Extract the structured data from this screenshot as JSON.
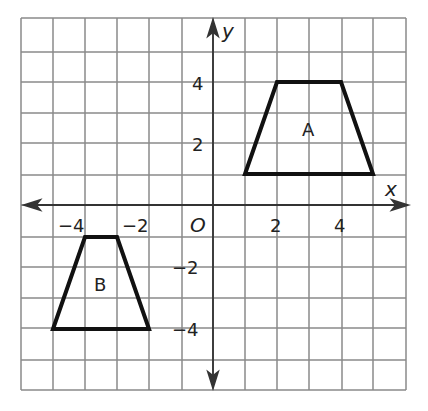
{
  "chart_data": {
    "type": "coordinate-grid",
    "title": "",
    "xlabel": "x",
    "ylabel": "y",
    "origin_label": "O",
    "xlim": [
      -6,
      6
    ],
    "ylim": [
      -6,
      6
    ],
    "grid": true,
    "x_tick_labels": [
      "-4",
      "-2",
      "2",
      "4"
    ],
    "y_tick_labels": [
      "4",
      "2",
      "-2",
      "-4"
    ],
    "shapes": [
      {
        "name": "A",
        "type": "trapezoid",
        "vertices": [
          [
            1,
            1
          ],
          [
            2,
            4
          ],
          [
            4,
            4
          ],
          [
            5,
            1
          ]
        ],
        "label_pos": [
          3,
          2.6
        ]
      },
      {
        "name": "B",
        "type": "trapezoid",
        "vertices": [
          [
            -5,
            -4
          ],
          [
            -4,
            -1
          ],
          [
            -3,
            -1
          ],
          [
            -2,
            -4
          ]
        ],
        "label_pos": [
          -3.5,
          -2.6
        ]
      }
    ]
  },
  "labels": {
    "x_axis": "x",
    "y_axis": "y",
    "origin": "O",
    "x_ticks": {
      "n4": "−4",
      "n2": "−2",
      "p2": "2",
      "p4": "4"
    },
    "y_ticks": {
      "p4": "4",
      "p2": "2",
      "n2": "−2",
      "n4": "−4"
    },
    "shape_a": "A",
    "shape_b": "B"
  },
  "colors": {
    "grid": "#8a8a8a",
    "axis": "#333333",
    "shape": "#111111"
  }
}
